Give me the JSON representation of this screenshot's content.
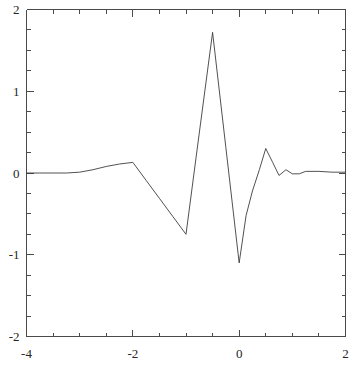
{
  "chart_data": {
    "type": "line",
    "title": "",
    "subtitle": "",
    "xlabel": "",
    "ylabel": "",
    "xlim": [
      -4,
      2
    ],
    "ylim": [
      -2,
      2
    ],
    "grid": false,
    "legend": null,
    "x_ticks": [
      -4,
      -2,
      0,
      2
    ],
    "x_tick_labels": [
      "-4",
      "-2",
      "0",
      "2"
    ],
    "x_minor_ticks": [
      -3.5,
      -3,
      -2.5,
      -1.5,
      -1,
      -0.5,
      0.5,
      1,
      1.5
    ],
    "y_ticks": [
      -2,
      -1,
      0,
      1,
      2
    ],
    "y_tick_labels": [
      "-2",
      "-1",
      "0",
      "1",
      "2"
    ],
    "y_minor_ticks": [
      -1.75,
      -1.5,
      -1.25,
      -0.75,
      -0.5,
      -0.25,
      0.25,
      0.5,
      0.75,
      1.25,
      1.5,
      1.75
    ],
    "series": [
      {
        "name": "wavelet",
        "color": "#3d3d3d",
        "x": [
          -4.0,
          -3.75,
          -3.5,
          -3.25,
          -3.0,
          -2.75,
          -2.5,
          -2.25,
          -2.0,
          -1.75,
          -1.5,
          -1.25,
          -1.0,
          -0.75,
          -0.5,
          -0.25,
          0.0,
          0.13,
          0.25,
          0.38,
          0.5,
          0.63,
          0.75,
          0.88,
          1.0,
          1.13,
          1.25,
          1.5,
          1.75,
          2.0
        ],
        "y": [
          0.0,
          0.0,
          0.0,
          0.0,
          0.01,
          0.04,
          0.08,
          0.11,
          0.13,
          -0.09,
          -0.31,
          -0.53,
          -0.75,
          0.49,
          1.72,
          0.31,
          -1.1,
          -0.52,
          -0.22,
          0.04,
          0.3,
          0.13,
          -0.03,
          0.04,
          -0.01,
          -0.01,
          0.02,
          0.02,
          0.01,
          0.01
        ]
      }
    ]
  },
  "axes": {
    "frame_color": "#4a4a4a",
    "background": "#ffffff"
  }
}
